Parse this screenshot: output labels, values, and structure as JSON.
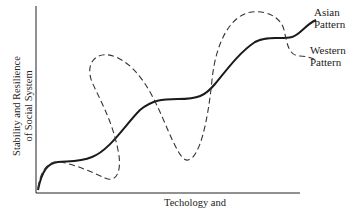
{
  "diagram": {
    "y_axis_label_line1": "Stability and Resilience",
    "y_axis_label_line2": "of Social System",
    "x_axis_label": "Techology and Environment",
    "series": [
      {
        "name": "Asian Pattern",
        "label_line1": "Asian",
        "label_line2": "Pattern",
        "style": "solid",
        "color": "#1a1a1a"
      },
      {
        "name": "Western Pattern",
        "label_line1": "Western",
        "label_line2": "Pattern",
        "style": "dashed",
        "color": "#333333"
      }
    ]
  }
}
